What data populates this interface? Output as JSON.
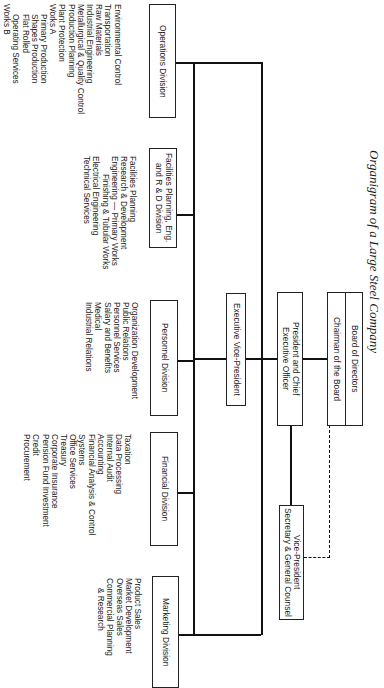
{
  "title": "Organigram of a Large Steel Company",
  "board": {
    "top": "Board of Directors",
    "bottom": "Chairman of the Board"
  },
  "president": {
    "line1": "President and Chief",
    "line2": "Executive Officer"
  },
  "vp_secretary": {
    "line1": "Vice-President",
    "line2": "Secretary & General Counsel"
  },
  "exec_vp": "Executive Vice-President",
  "divisions": {
    "operations": {
      "label": "Operations Division",
      "items": [
        "Environmental Control",
        "Transportation",
        "Raw Materials",
        "Industrial Engineering",
        "Metallurgical & Quality Control",
        "Production Planning",
        "Plant Protection",
        "Works A",
        "Primary Production",
        "Shapes Production",
        "Flat Rolled",
        "Operating Services",
        "Works B"
      ]
    },
    "facilities": {
      "label1": "Facilities Planning, Eng.",
      "label2": "and R & D Division",
      "items": [
        "Facilities Planning",
        "Research & Development",
        "Engineering — Primary Works",
        "Finishing & Tubular Works",
        "Electrical Engineering",
        "Technical Services"
      ]
    },
    "personnel": {
      "label": "Personnel Division",
      "items": [
        "Organization Development",
        "Public Relations",
        "Personnel Services",
        "Salary and Benefits",
        "Medical",
        "Industrial Relations"
      ]
    },
    "financial": {
      "label": "Financial Division",
      "items": [
        "Taxation",
        "Data Processing",
        "Internal Audit",
        "Accounting",
        "Financial Analysis & Control",
        "Systems",
        "Office Services",
        "Treasury",
        "Corporate Insurance",
        "Pension Fund Investment",
        "Credit",
        "Procurement"
      ]
    },
    "marketing": {
      "label": "Marketing Division",
      "items": [
        "Product Sales",
        "Market Development",
        "Overseas Sales",
        "Commercial Planning",
        "& Research"
      ]
    }
  }
}
